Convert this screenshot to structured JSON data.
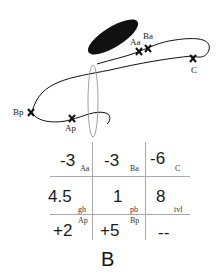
{
  "diagram": {
    "markers": [
      {
        "label": "Aa"
      },
      {
        "label": "Ba"
      },
      {
        "label": "C"
      },
      {
        "label": "Bp"
      },
      {
        "label": "Ap"
      }
    ]
  },
  "table": {
    "rows": [
      [
        {
          "value": "-3",
          "sub": "Aa"
        },
        {
          "value": "-3",
          "sub": "Ba"
        },
        {
          "value": "-6",
          "sub": "C"
        }
      ],
      [
        {
          "value": "4.5",
          "sub": "gh"
        },
        {
          "value": "1",
          "sub": "pb"
        },
        {
          "value": "8",
          "sub": "tvl"
        }
      ],
      [
        {
          "value": "+2",
          "sub": "Ap"
        },
        {
          "value": "+5",
          "sub": "Bp"
        },
        {
          "value": "--",
          "sub": ""
        }
      ]
    ]
  },
  "panel_label": "B",
  "colors": {
    "ink": "#111111",
    "grid": "#aaaaaa",
    "loop": "#888888"
  }
}
